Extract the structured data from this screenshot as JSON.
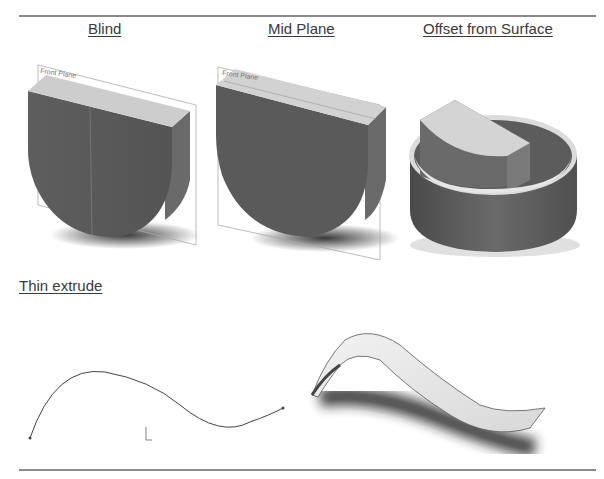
{
  "headings": {
    "blind": "Blind",
    "mid_plane": "Mid Plane",
    "offset_from_surface": "Offset from Surface",
    "thin_extrude": "Thin extrude"
  },
  "figures": {
    "blind": {
      "plane_label": "Front Plane"
    },
    "mid_plane": {
      "plane_label": "Front Plane"
    }
  },
  "colors": {
    "face_dark": "#5a5a5a",
    "face_top": "#cfcfcf",
    "rule": "#8a8a8a",
    "text": "#3a3a3a"
  }
}
